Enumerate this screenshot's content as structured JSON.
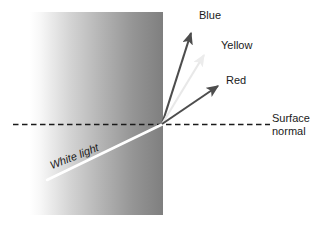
{
  "figure": {
    "canvas": {
      "width": 325,
      "height": 228,
      "background": "#ffffff"
    },
    "medium_block": {
      "name": "gradient-medium",
      "x": 30,
      "y": 12,
      "width": 133,
      "height": 203,
      "gradient_from": "#ffffff",
      "gradient_to": "#7f7f7f",
      "gradient_direction": "left-to-right"
    },
    "surface_normal_line": {
      "label_line1": "Surface",
      "label_line2": "normal",
      "style": "dashed",
      "color": "#1a1a1a",
      "x1": 13,
      "y1": 124,
      "x2": 270,
      "y2": 124
    },
    "incident_ray": {
      "label": "White light",
      "color": "#ffffff",
      "x1": 48,
      "y1": 179,
      "x2": 162,
      "y2": 124
    },
    "refracted_rays": [
      {
        "label": "Blue",
        "color": "#4d4d4d",
        "x1": 162,
        "y1": 124,
        "x2": 192,
        "y2": 31,
        "label_x": 199,
        "label_y": 9
      },
      {
        "label": "Yellow",
        "color": "#e8e8e8",
        "x1": 162,
        "y1": 124,
        "x2": 206,
        "y2": 53,
        "label_x": 221,
        "label_y": 39
      },
      {
        "label": "Red",
        "color": "#4d4d4d",
        "x1": 162,
        "y1": 124,
        "x2": 220,
        "y2": 84,
        "label_x": 226,
        "label_y": 74
      }
    ],
    "incidence_point": {
      "x": 162,
      "y": 124
    }
  },
  "labels": {
    "blue": "Blue",
    "yellow": "Yellow",
    "red": "Red",
    "surface_normal_line1": "Surface",
    "surface_normal_line2": "normal",
    "white_light": "White light"
  },
  "colors": {
    "text": "#1a1a1a",
    "arrow_dark": "#4d4d4d",
    "arrow_pale": "#e8e8e8",
    "incident_white": "#ffffff",
    "dashed_line": "#1a1a1a",
    "gradient_start": "#ffffff",
    "gradient_end": "#7f7f7f"
  }
}
